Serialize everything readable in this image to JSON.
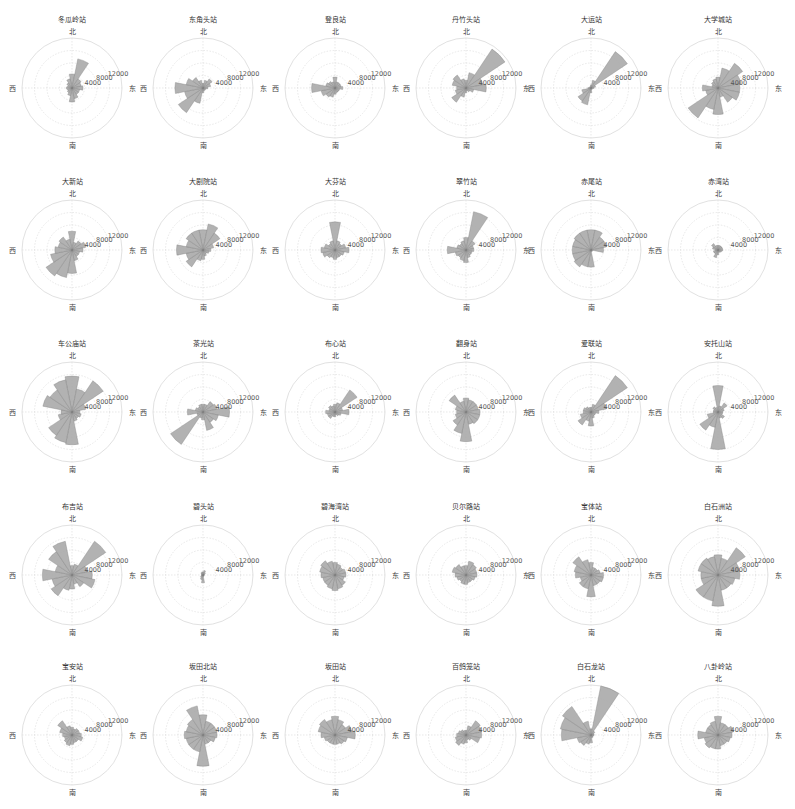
{
  "figure": {
    "layout": {
      "rows": 5,
      "cols": 6
    },
    "direction_labels": {
      "north": "北",
      "east": "东",
      "south": "南",
      "west": "西"
    },
    "radial_ticks": [
      "4000",
      "8000",
      "12000"
    ],
    "bar_color": "#aaaaaa",
    "bar_edge_color": "#7a7a7a",
    "grid_color": "#d9d9d9"
  },
  "chart_data": {
    "type": "polar_bar",
    "bins_deg": [
      0,
      22.5,
      45,
      67.5,
      90,
      112.5,
      135,
      157.5,
      180,
      202.5,
      225,
      247.5,
      270,
      292.5,
      315,
      337.5
    ],
    "rlim": [
      0,
      16000
    ],
    "rticks": [
      4000,
      8000,
      12000
    ],
    "theta_labels": [
      "北",
      "东",
      "南",
      "西"
    ],
    "stations": [
      {
        "name": "冬瓜岭站",
        "values": [
          4500,
          9500,
          3500,
          3000,
          3500,
          2500,
          2500,
          3500,
          4500,
          2500,
          1800,
          1500,
          1800,
          1500,
          2000,
          3000
        ]
      },
      {
        "name": "东角头站",
        "values": [
          1500,
          2500,
          3500,
          2500,
          1500,
          1000,
          800,
          1000,
          1500,
          5000,
          9500,
          6000,
          9000,
          5500,
          4000,
          2500
        ]
      },
      {
        "name": "登良站",
        "values": [
          3500,
          2000,
          2000,
          2000,
          2500,
          1500,
          1500,
          1500,
          2000,
          3000,
          3500,
          4500,
          7500,
          3000,
          2500,
          2000
        ]
      },
      {
        "name": "丹竹头站",
        "values": [
          2500,
          5000,
          15000,
          5500,
          6500,
          2500,
          1500,
          1000,
          1500,
          3000,
          5500,
          3500,
          3000,
          4500,
          5000,
          3000
        ]
      },
      {
        "name": "大运站",
        "values": [
          1000,
          2500,
          14000,
          1500,
          1000,
          500,
          500,
          500,
          1500,
          5500,
          5000,
          3000,
          1000,
          500,
          500,
          500
        ]
      },
      {
        "name": "大学城站",
        "values": [
          3500,
          6500,
          9500,
          7500,
          7000,
          7000,
          5500,
          3000,
          8500,
          7000,
          11500,
          4000,
          5000,
          2000,
          2500,
          3000
        ]
      },
      {
        "name": "大新站",
        "values": [
          6000,
          2500,
          3500,
          4500,
          3500,
          2500,
          2500,
          3500,
          7500,
          9000,
          10000,
          7000,
          5500,
          4500,
          5000,
          3500
        ]
      },
      {
        "name": "大剧院站",
        "values": [
          6500,
          8500,
          6500,
          3500,
          2500,
          2000,
          1500,
          2000,
          3000,
          3500,
          6500,
          5500,
          8500,
          5500,
          6500,
          6500
        ]
      },
      {
        "name": "大芬站",
        "values": [
          9000,
          3000,
          2500,
          3500,
          4500,
          3000,
          2500,
          2500,
          3000,
          2500,
          3000,
          4000,
          4500,
          3500,
          2500,
          3000
        ]
      },
      {
        "name": "翠竹站",
        "values": [
          4000,
          12500,
          3500,
          2500,
          2500,
          2000,
          2000,
          2500,
          4000,
          3500,
          3000,
          3500,
          6000,
          3000,
          2500,
          3000
        ]
      },
      {
        "name": "赤尾站",
        "values": [
          6500,
          6500,
          5000,
          5000,
          4000,
          500,
          500,
          500,
          5500,
          5500,
          6500,
          6000,
          6000,
          6000,
          6500,
          6500
        ]
      },
      {
        "name": "赤湾站",
        "values": [
          1500,
          1500,
          1500,
          1500,
          1500,
          1200,
          1000,
          800,
          1500,
          2500,
          1500,
          1500,
          1000,
          1800,
          2500,
          1500
        ]
      },
      {
        "name": "车公庙站",
        "values": [
          11500,
          7500,
          12000,
          4500,
          2500,
          3000,
          2500,
          3000,
          10500,
          10000,
          9000,
          4500,
          3500,
          9500,
          8500,
          10500
        ]
      },
      {
        "name": "茶光站",
        "values": [
          2500,
          2500,
          4000,
          4500,
          8500,
          5000,
          4000,
          6000,
          2500,
          2000,
          12500,
          2000,
          5000,
          2500,
          2000,
          2500
        ]
      },
      {
        "name": "布心站",
        "values": [
          2500,
          3000,
          8500,
          2500,
          4500,
          2000,
          1500,
          1000,
          1500,
          1500,
          2500,
          2500,
          3000,
          2000,
          2500,
          2000
        ]
      },
      {
        "name": "翻身站",
        "values": [
          4500,
          4000,
          4000,
          4000,
          4500,
          4500,
          4500,
          4000,
          9500,
          7000,
          5000,
          3500,
          3000,
          3500,
          6500,
          3500
        ]
      },
      {
        "name": "爱联站",
        "values": [
          1500,
          2500,
          14000,
          5000,
          2500,
          1500,
          1500,
          2000,
          4500,
          3000,
          5000,
          3500,
          2500,
          2500,
          2000,
          1500
        ]
      },
      {
        "name": "安托山站",
        "values": [
          8500,
          2000,
          3500,
          2000,
          1500,
          1500,
          2500,
          2000,
          12000,
          5000,
          7000,
          3500,
          1500,
          1500,
          2000,
          1500
        ]
      },
      {
        "name": "布吉站",
        "values": [
          3000,
          3500,
          13000,
          5000,
          6500,
          7500,
          4500,
          3000,
          4500,
          5000,
          8000,
          6500,
          9500,
          5500,
          9000,
          11000
        ]
      },
      {
        "name": "碧头站",
        "values": [
          1000,
          1500,
          1000,
          500,
          500,
          300,
          300,
          500,
          2500,
          1500,
          1000,
          600,
          500,
          500,
          800,
          1000
        ]
      },
      {
        "name": "碧海湾站",
        "values": [
          4000,
          3500,
          3000,
          3500,
          3500,
          3000,
          4000,
          4500,
          5000,
          4500,
          4000,
          4000,
          4500,
          5000,
          5500,
          4500
        ]
      },
      {
        "name": "贝尔路站",
        "values": [
          3000,
          4500,
          4000,
          3500,
          3500,
          3000,
          2500,
          2500,
          3000,
          3000,
          2500,
          3000,
          3500,
          4500,
          4000,
          3000
        ]
      },
      {
        "name": "宝体站",
        "values": [
          4000,
          2500,
          2500,
          3000,
          4000,
          4000,
          3500,
          3500,
          7000,
          4500,
          4500,
          3500,
          5000,
          5500,
          7000,
          5000
        ]
      },
      {
        "name": "白石洲站",
        "values": [
          6500,
          5500,
          10500,
          7000,
          7000,
          5500,
          5000,
          5000,
          10000,
          8500,
          8500,
          5500,
          5500,
          6500,
          6500,
          6000
        ]
      },
      {
        "name": "宝安站",
        "values": [
          2500,
          2000,
          2500,
          2500,
          3000,
          3500,
          2500,
          2500,
          3000,
          3500,
          3000,
          2500,
          3000,
          4000,
          5500,
          3000
        ]
      },
      {
        "name": "坂田北站",
        "values": [
          6500,
          4500,
          4500,
          4500,
          4500,
          4000,
          3000,
          3000,
          10000,
          5500,
          5500,
          5500,
          6000,
          5500,
          6000,
          9500
        ]
      },
      {
        "name": "坂田站",
        "values": [
          6000,
          5000,
          4000,
          5500,
          6500,
          4000,
          3500,
          3000,
          3000,
          3000,
          3000,
          3500,
          4500,
          5500,
          6000,
          5000
        ]
      },
      {
        "name": "百鸽笼站",
        "values": [
          1500,
          3000,
          5500,
          5000,
          5000,
          4500,
          2000,
          1500,
          2500,
          3000,
          4000,
          3500,
          3000,
          2500,
          2000,
          1500
        ]
      },
      {
        "name": "白石龙站",
        "values": [
          2000,
          16000,
          1500,
          1000,
          1000,
          800,
          800,
          1000,
          2500,
          3000,
          4000,
          4500,
          9500,
          10000,
          11000,
          4500
        ]
      },
      {
        "name": "八卦岭站",
        "values": [
          6000,
          4000,
          4000,
          5000,
          4500,
          4000,
          3500,
          3500,
          4500,
          4500,
          5000,
          4500,
          6500,
          4000,
          4000,
          4500
        ]
      }
    ]
  }
}
